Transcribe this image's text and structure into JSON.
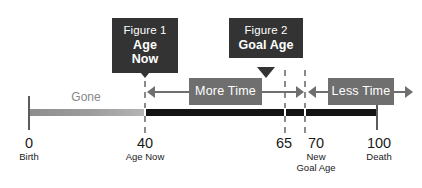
{
  "diagram": {
    "title_hidden": "",
    "timeline": {
      "gone_label": "Gone",
      "segments": [
        {
          "name": "gone",
          "from": 0,
          "to": 40,
          "color": "#9d9d9d"
        },
        {
          "name": "remaining",
          "from": 40,
          "to": 100,
          "color": "#141414"
        }
      ],
      "axis_min": 0,
      "axis_max": 100
    },
    "ticks": [
      {
        "value": "0",
        "sub": "Birth",
        "sub2": "",
        "age": 0
      },
      {
        "value": "40",
        "sub": "Age Now",
        "sub2": "",
        "age": 40
      },
      {
        "value": "65",
        "sub": "",
        "sub2": "",
        "age": 65
      },
      {
        "value": "70",
        "sub": "New",
        "sub2": "Goal Age",
        "age": 70
      },
      {
        "value": "100",
        "sub": "Death",
        "sub2": "",
        "age": 100
      }
    ],
    "callouts": [
      {
        "line1": "Figure 1",
        "line2": "Age Now",
        "age": 40
      },
      {
        "line1": "Figure 2",
        "line2": "Goal Age",
        "age": 67
      }
    ],
    "spans": [
      {
        "label": "More Time",
        "from": 40,
        "to": 70
      },
      {
        "label": "Less Time",
        "from": 70,
        "to": 100
      }
    ],
    "colors": {
      "callout_bg": "#333333",
      "span_bg": "#6f6f6f",
      "bar_gone": "#9d9d9d",
      "bar_remaining": "#141414",
      "text_dark": "#1a1a1a",
      "text_muted": "#878787"
    }
  }
}
